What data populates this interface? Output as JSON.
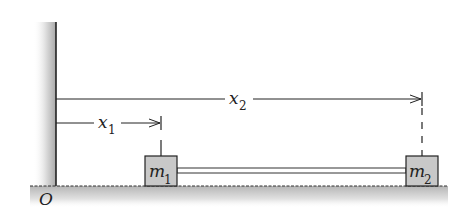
{
  "diagram": {
    "origin_label": "O",
    "mass1": {
      "label": "m",
      "subscript": "1"
    },
    "mass2": {
      "label": "m",
      "subscript": "2"
    },
    "distance1": {
      "label": "x",
      "subscript": "1"
    },
    "distance2": {
      "label": "x",
      "subscript": "2"
    },
    "colors": {
      "line": "#222222",
      "block_fill": "#c8c8c8",
      "wall_shade": "#b9b9b9",
      "floor_shade": "#c4c4c4",
      "background": "#ffffff"
    }
  }
}
